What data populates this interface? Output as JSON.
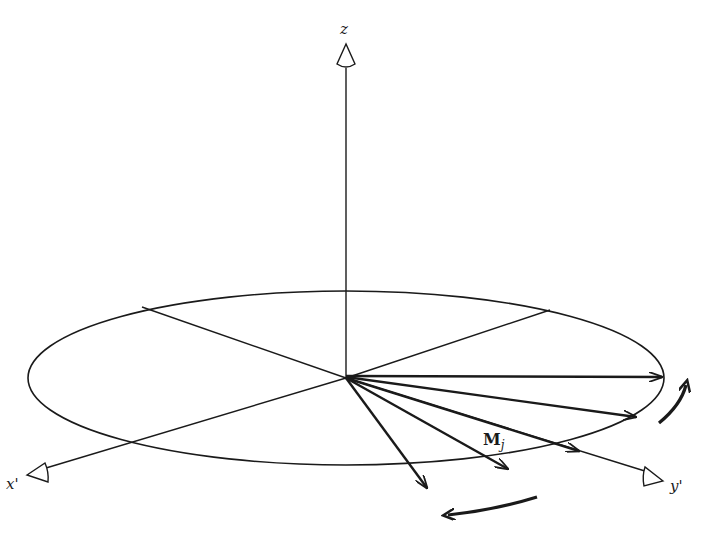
{
  "figure": {
    "colors": {
      "ink": "#1a1a1a",
      "background": "#ffffff"
    }
  },
  "axes": {
    "z_label": "z",
    "x_label": "x'",
    "y_label": "y'"
  },
  "vectors": {
    "label_main": "M",
    "label_sub": "j",
    "count": 5
  },
  "rotation_arrows": {
    "right": "counterclockwise-up",
    "bottom": "leftward"
  }
}
